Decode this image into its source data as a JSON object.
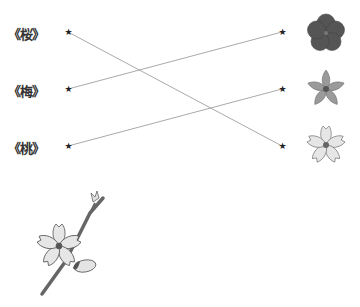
{
  "left_items": [
    {
      "label": "《桜》",
      "y": 32
    },
    {
      "label": "《梅》",
      "y": 89
    },
    {
      "label": "《桃》",
      "y": 146
    }
  ],
  "right_items": [
    {
      "icon": "dark-plum-flower-icon",
      "y": 32,
      "color": "#555555"
    },
    {
      "icon": "peach-flower-icon",
      "y": 89,
      "color": "#999999"
    },
    {
      "icon": "cherry-blossom-icon",
      "y": 146,
      "color": "#e4e4e4"
    }
  ],
  "star_glyph": "★",
  "connections": [
    {
      "from": 0,
      "to": 2
    },
    {
      "from": 1,
      "to": 0
    },
    {
      "from": 2,
      "to": 1
    }
  ],
  "line_color": "#aaaaaa"
}
